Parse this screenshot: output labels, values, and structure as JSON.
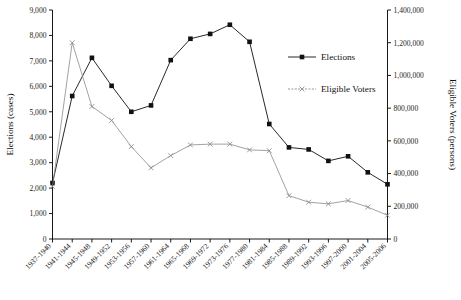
{
  "chart_data": {
    "type": "line",
    "title": "",
    "xlabel": "",
    "ylabel": "Elections (cases)",
    "y2label": "Eligible Voters (persons)",
    "ylim": [
      0,
      9000
    ],
    "y2lim": [
      0,
      1400000
    ],
    "ytick_step": 1000,
    "y2tick_step": 200000,
    "grid": false,
    "legend_position": "upper-right-inside",
    "categories": [
      "1937-1940",
      "1941-1944",
      "1945-1948",
      "1949-1952",
      "1953-1956",
      "1957-1960",
      "1961-1964",
      "1965-1968",
      "1969-1972",
      "1973-1976",
      "1977-1980",
      "1981-1984",
      "1985-1988",
      "1989-1992",
      "1993-1996",
      "1997-2000",
      "2001-2004",
      "2005-2006"
    ],
    "ytick_labels": [
      "0",
      "1,000",
      "2,000",
      "3,000",
      "4,000",
      "5,000",
      "6,000",
      "7,000",
      "8,000",
      "9,000"
    ],
    "y2tick_labels": [
      "0",
      "200,000",
      "400,000",
      "600,000",
      "800,000",
      "1,000,000",
      "1,200,000",
      "1,400,000"
    ],
    "series": [
      {
        "name": "Elections",
        "axis": "left",
        "marker": "square",
        "color": "#111111",
        "values": [
          2200,
          5620,
          7120,
          6020,
          5000,
          5250,
          7030,
          7870,
          8060,
          8420,
          7750,
          4520,
          3600,
          3520,
          3070,
          3250,
          2620,
          2150
        ]
      },
      {
        "name": "Eligible Voters",
        "axis": "right",
        "marker": "x",
        "color": "#8a8a8a",
        "values": [
          320000,
          1200000,
          810000,
          725000,
          565000,
          435000,
          510000,
          575000,
          580000,
          580000,
          545000,
          540000,
          265000,
          225000,
          215000,
          235000,
          195000,
          145000
        ]
      }
    ],
    "legend": [
      {
        "label": "Elections",
        "marker": "square",
        "color": "#111111"
      },
      {
        "label": "Eligible Voters",
        "marker": "x",
        "color": "#8a8a8a"
      }
    ]
  }
}
